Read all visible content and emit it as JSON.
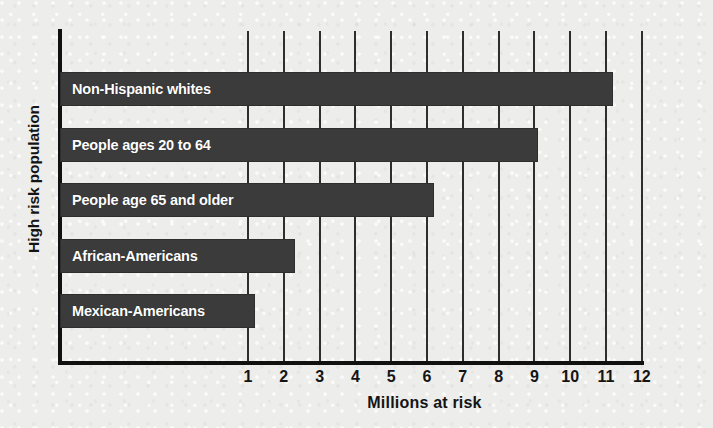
{
  "chart_data": {
    "type": "bar",
    "orientation": "horizontal",
    "title": "",
    "xlabel": "Millions at risk",
    "ylabel": "High risk population",
    "categories": [
      "Non-Hispanic whites",
      "People ages 20 to 64",
      "People age 65 and older",
      "African-Americans",
      "Mexican-Americans"
    ],
    "values": [
      11.2,
      9.1,
      6.2,
      2.3,
      1.2
    ],
    "xlim": [
      0,
      12.5
    ],
    "xticks": [
      1,
      2,
      3,
      4,
      5,
      6,
      7,
      8,
      9,
      10,
      11,
      12
    ],
    "xtick_labels": [
      "1",
      "2",
      "3",
      "4",
      "5",
      "6",
      "7",
      "8",
      "9",
      "10",
      "11",
      "12"
    ],
    "grid": "vertical",
    "legend": "none",
    "bar_color": "#3b3b3b",
    "bar_label_color": "#ffffff",
    "axis_color": "#111111",
    "gridline_color": "#2e2e2e",
    "background_color": "#ededeb"
  }
}
